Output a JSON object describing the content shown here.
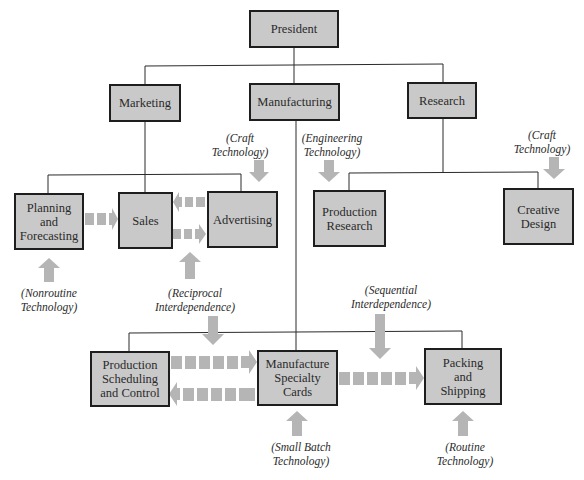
{
  "diagram": {
    "colors": {
      "box_fill": "#c9c9c9",
      "box_border": "#1e1e1e",
      "connector": "#2a2a2a",
      "arrow": "#b5b5b5",
      "text": "#2a2a2a"
    },
    "nodes": {
      "president": "President",
      "marketing": "Marketing",
      "manufacturing": "Manufacturing",
      "research": "Research",
      "planning": "Planning\nand\nForecasting",
      "sales": "Sales",
      "advertising": "Advertising",
      "production_research": "Production\nResearch",
      "creative_design": "Creative\nDesign",
      "production_scheduling": "Production\nScheduling\nand Control",
      "manufacture_cards": "Manufacture\nSpecialty\nCards",
      "packing": "Packing\nand\nShipping"
    },
    "annotations": {
      "craft_advertising": "(Craft\nTechnology)",
      "engineering": "(Engineering\nTechnology)",
      "craft_design": "(Craft\nTechnology)",
      "nonroutine": "(Nonroutine\nTechnology)",
      "reciprocal": "(Reciprocal\nInterdependence)",
      "sequential": "(Sequential\nInterdependence)",
      "small_batch": "(Small Batch\nTechnology)",
      "routine": "(Routine\nTechnology)"
    },
    "edges": [
      {
        "from": "President",
        "to": "Marketing",
        "type": "hierarchy"
      },
      {
        "from": "President",
        "to": "Manufacturing",
        "type": "hierarchy"
      },
      {
        "from": "President",
        "to": "Research",
        "type": "hierarchy"
      },
      {
        "from": "Marketing",
        "to": "Planning and Forecasting",
        "type": "hierarchy"
      },
      {
        "from": "Marketing",
        "to": "Sales",
        "type": "hierarchy"
      },
      {
        "from": "Marketing",
        "to": "Advertising",
        "type": "hierarchy"
      },
      {
        "from": "Research",
        "to": "Production Research",
        "type": "hierarchy"
      },
      {
        "from": "Research",
        "to": "Creative Design",
        "type": "hierarchy"
      },
      {
        "from": "Manufacturing",
        "to": "Production Scheduling and Control",
        "type": "hierarchy"
      },
      {
        "from": "Manufacturing",
        "to": "Manufacture Specialty Cards",
        "type": "hierarchy"
      },
      {
        "from": "Manufacturing",
        "to": "Packing and Shipping",
        "type": "hierarchy"
      },
      {
        "from": "Planning and Forecasting",
        "to": "Sales",
        "type": "workflow"
      },
      {
        "from": "Advertising",
        "to": "Sales",
        "type": "workflow"
      },
      {
        "from": "Sales",
        "to": "Advertising",
        "type": "workflow"
      },
      {
        "from": "Production Scheduling and Control",
        "to": "Manufacture Specialty Cards",
        "type": "workflow"
      },
      {
        "from": "Manufacture Specialty Cards",
        "to": "Production Scheduling and Control",
        "type": "workflow"
      },
      {
        "from": "Manufacture Specialty Cards",
        "to": "Packing and Shipping",
        "type": "workflow"
      }
    ]
  }
}
